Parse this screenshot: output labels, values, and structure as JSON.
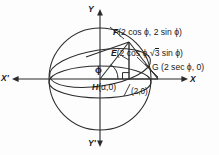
{
  "figure": {
    "type": "geometry-diagram",
    "stroke_color": "#2b2b2b",
    "text_color": "#1a1a1a",
    "background": "#fdfdfd"
  },
  "axes": {
    "x_positive_label": "X",
    "x_negative_label": "X'",
    "y_positive_label": "Y",
    "y_negative_label": "Y'"
  },
  "angle": {
    "symbol": "ϕ"
  },
  "points": [
    {
      "key": "F",
      "name": "F",
      "coords": "(2 cos ϕ, 2 sin ϕ)",
      "label_prefix": "F (2 cos ϕ, 2 sin ϕ)"
    },
    {
      "key": "E",
      "name": "E",
      "coords_before_radical": "(2 cos ϕ,",
      "radical": "3",
      "coords_after_radical": " sin ϕ)",
      "label_full": "E (2 cos ϕ, √3 sin ϕ)"
    },
    {
      "key": "G",
      "name": "G",
      "coords": "(2 sec ϕ, 0)",
      "label_prefix": "G (2 sec ϕ, 0)"
    },
    {
      "key": "H",
      "name": "H",
      "coords": "(α,0)",
      "label_prefix": "H(α,0)"
    }
  ],
  "markers": {
    "x_intercept": "(2,0)"
  }
}
